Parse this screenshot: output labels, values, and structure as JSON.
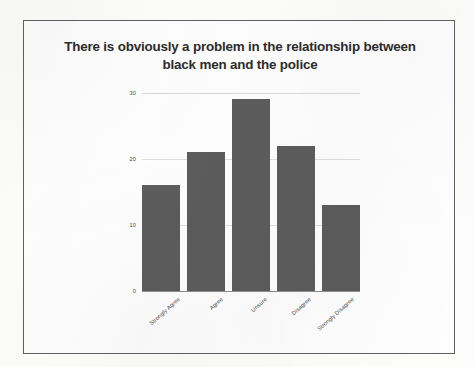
{
  "slide": {
    "title_line1": "There is obviously a problem in the relationship between",
    "title_line2": "black men and the police"
  },
  "chart_data": {
    "type": "bar",
    "title": "There is obviously a problem in the relationship between black men and the police",
    "xlabel": "",
    "ylabel": "",
    "categories": [
      "Strongly Agree",
      "Agree",
      "Unsure",
      "Disagree",
      "Strongly Disagree"
    ],
    "values": [
      16,
      21,
      29,
      22,
      13
    ],
    "ylim": [
      0,
      31
    ],
    "yticks": [
      "0",
      "10",
      "20",
      "30"
    ],
    "ytick_values": [
      0,
      10,
      20,
      30
    ],
    "grid": true,
    "legend": "none",
    "bar_color": "#5c5c5c",
    "gridline_color": "#dededd",
    "axis_color": "#8d8d8d",
    "text_color": "#4a4a4a"
  }
}
